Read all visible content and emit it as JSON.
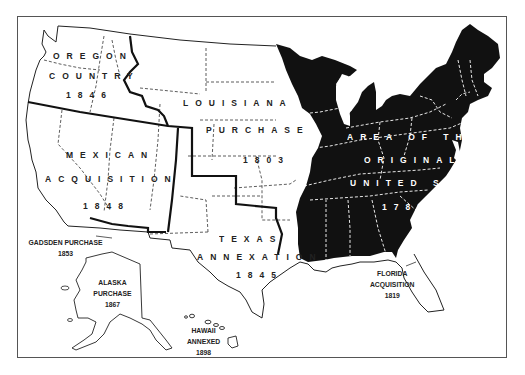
{
  "map": {
    "title": "Territorial Expansion of the United States",
    "colors": {
      "original_states_fill": "#111111",
      "outline": "#222222",
      "state_boundary_dashed": "#333333",
      "internal_dashed_on_black": "#ffffff",
      "background": "#ffffff",
      "frame": "#555555"
    },
    "regions": [
      {
        "id": "oregon",
        "lines": [
          "OREGON",
          "COUNTRY",
          "1846"
        ]
      },
      {
        "id": "louisiana",
        "lines": [
          "LOUISIANA",
          "PURCHASE",
          "1803"
        ]
      },
      {
        "id": "mexican",
        "lines": [
          "MEXICAN",
          "ACQUISITION",
          "1848"
        ]
      },
      {
        "id": "original",
        "lines": [
          "AREA OF THE",
          "ORIGINAL",
          "UNITED STATES",
          "1783"
        ]
      },
      {
        "id": "texas",
        "lines": [
          "TEXAS",
          "ANNEXATION",
          "1845"
        ]
      },
      {
        "id": "gadsden",
        "lines": [
          "GADSDEN PURCHASE",
          "1853"
        ]
      },
      {
        "id": "alaska",
        "lines": [
          "ALASKA",
          "PURCHASE",
          "1867"
        ]
      },
      {
        "id": "hawaii",
        "lines": [
          "HAWAII",
          "ANNEXED",
          "1898"
        ]
      },
      {
        "id": "florida",
        "lines": [
          "FLORIDA",
          "ACQUISITION",
          "1819"
        ]
      }
    ]
  }
}
